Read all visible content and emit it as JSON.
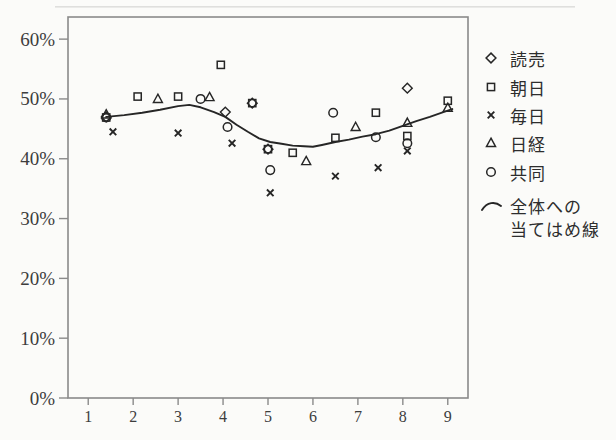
{
  "page": {
    "background": "#fbfbf9",
    "ink": "#262626",
    "frame_color": "#8a8a8a",
    "text_color": "#3d3d3d"
  },
  "chart_data": {
    "type": "scatter",
    "title": "",
    "xlabel": "",
    "ylabel": "",
    "grid": false,
    "legend_position": "right",
    "x_axis": {
      "ticks": [
        1,
        2,
        3,
        4,
        5,
        6,
        7,
        8,
        9
      ],
      "min": 0.55,
      "max": 9.45
    },
    "y_axis": {
      "tick_values": [
        0,
        10,
        20,
        30,
        40,
        50,
        60
      ],
      "tick_suffix": "%",
      "min": 0,
      "max": 63.7
    },
    "series": [
      {
        "key": "yomiuri",
        "name": "読売",
        "marker": "diamond",
        "points": [
          [
            1.4,
            47.0
          ],
          [
            4.05,
            47.8
          ],
          [
            4.65,
            49.3
          ],
          [
            5.0,
            41.6
          ],
          [
            8.1,
            51.8
          ]
        ]
      },
      {
        "key": "asahi",
        "name": "朝日",
        "marker": "square",
        "points": [
          [
            1.4,
            46.9
          ],
          [
            2.1,
            50.4
          ],
          [
            3.0,
            50.4
          ],
          [
            3.95,
            55.7
          ],
          [
            4.65,
            49.3
          ],
          [
            5.0,
            41.6
          ],
          [
            5.55,
            41.0
          ],
          [
            6.5,
            43.5
          ],
          [
            7.4,
            47.7
          ],
          [
            8.1,
            43.8
          ],
          [
            9.0,
            49.7
          ]
        ]
      },
      {
        "key": "mainichi",
        "name": "毎日",
        "marker": "x",
        "points": [
          [
            1.55,
            44.5
          ],
          [
            3.0,
            44.3
          ],
          [
            4.2,
            42.6
          ],
          [
            5.05,
            34.3
          ],
          [
            6.5,
            37.1
          ],
          [
            7.45,
            38.5
          ],
          [
            8.1,
            41.3
          ]
        ]
      },
      {
        "key": "nikkei",
        "name": "日経",
        "marker": "triangle",
        "points": [
          [
            1.4,
            47.4
          ],
          [
            2.55,
            50.0
          ],
          [
            3.7,
            50.3
          ],
          [
            5.85,
            39.6
          ],
          [
            6.95,
            45.3
          ],
          [
            8.1,
            46.0
          ],
          [
            9.0,
            48.5
          ]
        ]
      },
      {
        "key": "kyodo",
        "name": "共同",
        "marker": "circle",
        "points": [
          [
            1.4,
            46.9
          ],
          [
            3.5,
            50.0
          ],
          [
            4.1,
            45.3
          ],
          [
            5.05,
            38.1
          ],
          [
            6.45,
            47.7
          ],
          [
            7.4,
            43.6
          ],
          [
            8.1,
            42.6
          ]
        ]
      }
    ],
    "fit_line": {
      "key": "fit-line",
      "name": "全体への当てはめ線",
      "legend_lines": [
        "全体への",
        "当てはめ線"
      ],
      "points": [
        [
          1.4,
          47.0
        ],
        [
          1.8,
          47.3
        ],
        [
          2.2,
          47.7
        ],
        [
          2.6,
          48.2
        ],
        [
          3.0,
          48.8
        ],
        [
          3.25,
          49.0
        ],
        [
          3.5,
          48.6
        ],
        [
          3.8,
          47.8
        ],
        [
          4.05,
          47.0
        ],
        [
          4.3,
          45.7
        ],
        [
          4.55,
          44.5
        ],
        [
          4.8,
          43.4
        ],
        [
          5.05,
          42.8
        ],
        [
          5.3,
          42.5
        ],
        [
          5.55,
          42.2
        ],
        [
          5.8,
          42.1
        ],
        [
          6.0,
          42.0
        ],
        [
          6.2,
          42.3
        ],
        [
          6.5,
          42.8
        ],
        [
          6.8,
          43.2
        ],
        [
          7.1,
          43.7
        ],
        [
          7.4,
          44.1
        ],
        [
          7.7,
          44.7
        ],
        [
          8.0,
          45.5
        ],
        [
          8.3,
          46.3
        ],
        [
          8.6,
          47.0
        ],
        [
          8.9,
          47.8
        ],
        [
          9.1,
          48.3
        ]
      ]
    }
  }
}
